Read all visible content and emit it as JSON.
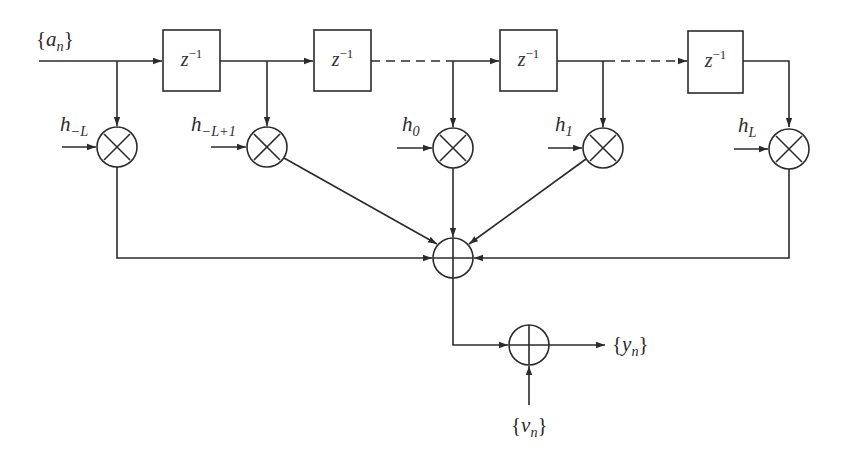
{
  "diagram": {
    "type": "transversal-filter-block-diagram",
    "input": {
      "label": "{a_n}",
      "base": "a",
      "sub": "n"
    },
    "delay_blocks": [
      {
        "id": "delay-1",
        "label": "z^-1",
        "base": "z",
        "sup": "−1"
      },
      {
        "id": "delay-2",
        "label": "z^-1",
        "base": "z",
        "sup": "−1"
      },
      {
        "id": "delay-3",
        "label": "z^-1",
        "base": "z",
        "sup": "−1"
      },
      {
        "id": "delay-4",
        "label": "z^-1",
        "base": "z",
        "sup": "−1"
      }
    ],
    "taps": [
      {
        "id": "tap-minus-L",
        "label": "h_{-L}",
        "base": "h",
        "sub": "−L"
      },
      {
        "id": "tap-minus-L-plus-1",
        "label": "h_{-L+1}",
        "base": "h",
        "sub": "−L+1"
      },
      {
        "id": "tap-0",
        "label": "h_0",
        "base": "h",
        "sub": "0"
      },
      {
        "id": "tap-1",
        "label": "h_1",
        "base": "h",
        "sub": "1"
      },
      {
        "id": "tap-L",
        "label": "h_L",
        "base": "h",
        "sub": "L"
      }
    ],
    "multiplier_symbol": "⊗",
    "adder_symbol": "⊕",
    "noise": {
      "label": "{v_n}",
      "base": "v",
      "sub": "n"
    },
    "output": {
      "label": "{y_n}",
      "base": "y",
      "sub": "n"
    },
    "colors": {
      "stroke": "#2b2b2b",
      "background": "#ffffff"
    }
  }
}
